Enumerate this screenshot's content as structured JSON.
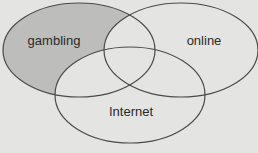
{
  "diagram": {
    "type": "venn",
    "background": "#e4e4e2",
    "sets": [
      {
        "id": "gambling",
        "label": "gambling",
        "shaded": true,
        "shade_color": "#bdbdbb"
      },
      {
        "id": "online",
        "label": "online",
        "shaded": false
      },
      {
        "id": "internet",
        "label": "Internet",
        "shaded": false
      }
    ],
    "shaded_region": "gambling NOT online NOT Internet"
  }
}
